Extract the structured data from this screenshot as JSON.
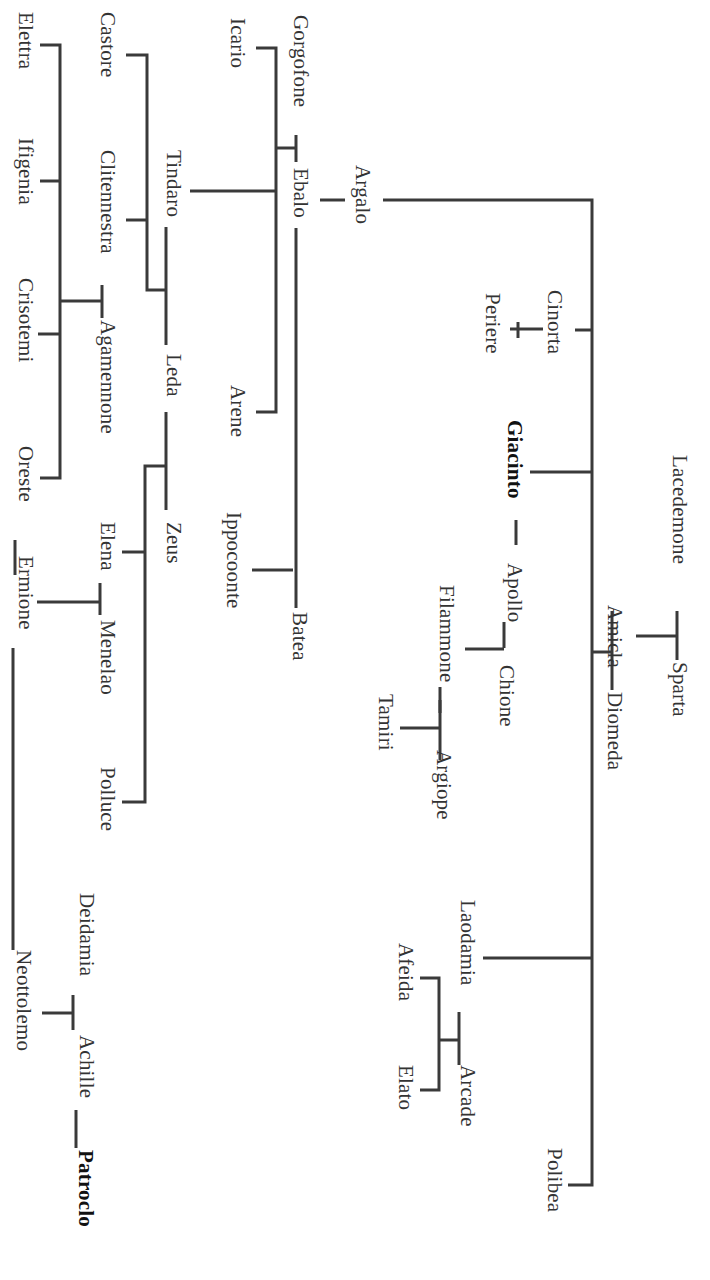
{
  "diagram": {
    "type": "genealogical-tree",
    "orientation": "rotated-90-clockwise",
    "line_color": "#3a3a3a",
    "text_color": "#333333",
    "highlighted": [
      "Giacinto",
      "Patroclo"
    ],
    "people": {
      "lacedemone": "Lacedemone",
      "sparta": "Sparta",
      "amicla": "Amicla",
      "diomeda": "Diomeda",
      "argalo": "Argalo",
      "cinorta": "Cinorta",
      "periere": "Periere",
      "giacinto": "Giacinto",
      "apollo": "Apollo",
      "chione": "Chione",
      "filammone": "Filammone",
      "argiope": "Argiope",
      "tamiri": "Tamiri",
      "laodamia": "Laodamia",
      "arcade": "Arcade",
      "afeida": "Afeida",
      "elato": "Elato",
      "polibea": "Polibea",
      "gorgofone": "Gorgofone",
      "ebalo": "Ebalo",
      "icario": "Icario",
      "arene": "Arene",
      "tindaro": "Tindaro",
      "ippocoonte": "Ippocoonte",
      "batea": "Batea",
      "castore": "Castore",
      "clitennestra": "Clitennestra",
      "leda": "Leda",
      "zeus": "Zeus",
      "agamennone": "Agamennone",
      "elena": "Elena",
      "menelao": "Menelao",
      "polluce": "Polluce",
      "elettra": "Elettra",
      "ifigenia": "Ifigenia",
      "crisotemi": "Crisotemi",
      "oreste": "Oreste",
      "ermione": "Ermione",
      "neottolemo": "Neottolemo",
      "deidamia": "Deidamia",
      "achille": "Achille",
      "patroclo": "Patroclo"
    },
    "relations": [
      {
        "couple": [
          "Lacedemone",
          "Sparta"
        ],
        "children": [
          "Amicla"
        ]
      },
      {
        "couple": [
          "Amicla",
          "Diomeda"
        ],
        "children": [
          "Argalo",
          "Cinorta",
          "Giacinto",
          "Laodamia",
          "Polibea"
        ]
      },
      {
        "lovers": [
          "Giacinto",
          "Apollo"
        ]
      },
      {
        "couple": [
          "Apollo",
          "Chione"
        ],
        "children": [
          "Filammone"
        ]
      },
      {
        "couple": [
          "Filammone",
          "Argiope"
        ],
        "children": [
          "Tamiri"
        ]
      },
      {
        "couple": [
          "Laodamia",
          "Arcade"
        ],
        "children": [
          "Afeida",
          "Elato"
        ]
      },
      {
        "parent": "Cinorta",
        "children": [
          "Periere"
        ]
      },
      {
        "couple": [
          "Gorgofone",
          "Ebalo"
        ],
        "children": [
          "Icario",
          "Tindaro",
          "Arene"
        ]
      },
      {
        "couple": [
          "Ebalo",
          "Batea"
        ],
        "children": [
          "Ippocoonte"
        ]
      },
      {
        "couple": [
          "Tindaro",
          "Leda"
        ],
        "children": [
          "Castore",
          "Clitennestra"
        ]
      },
      {
        "couple": [
          "Leda",
          "Zeus"
        ],
        "children": [
          "Elena",
          "Polluce"
        ]
      },
      {
        "couple": [
          "Clitennestra",
          "Agamennone"
        ],
        "children": [
          "Elettra",
          "Ifigenia",
          "Crisotemi",
          "Oreste"
        ]
      },
      {
        "couple": [
          "Elena",
          "Menelao"
        ],
        "children": [
          "Ermione"
        ]
      },
      {
        "couple": [
          "Oreste",
          "Ermione"
        ]
      },
      {
        "couple": [
          "Ermione",
          "Neottolemo"
        ]
      },
      {
        "couple": [
          "Deidamia",
          "Achille"
        ],
        "children": [
          "Neottolemo"
        ]
      },
      {
        "lovers": [
          "Achille",
          "Patroclo"
        ]
      }
    ]
  }
}
